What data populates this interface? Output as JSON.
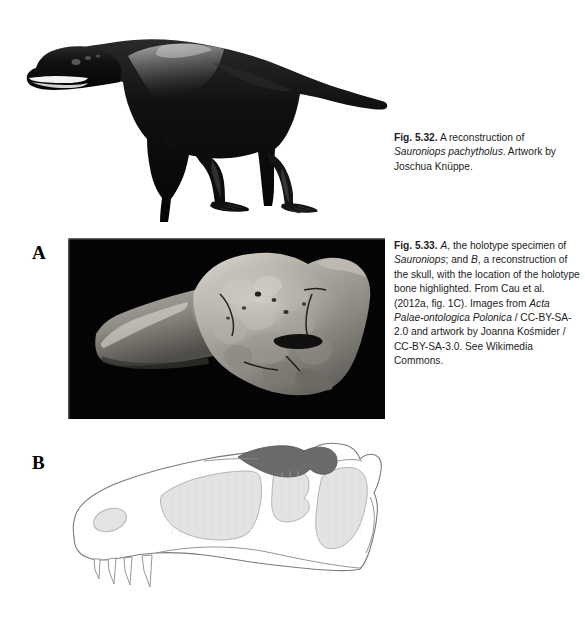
{
  "page": {
    "background_color": "#ffffff",
    "width": 585,
    "height": 621
  },
  "figures": [
    {
      "id": "fig-5-32",
      "number": "Fig. 5.32.",
      "artwork_name": "sauroniops-life-reconstruction",
      "artwork_description": "Black silhouette-style life reconstruction of a large theropod dinosaur standing in left lateral view",
      "caption": {
        "number": "Fig. 5.32.",
        "text_part_1": "A reconstruction of ",
        "italic_1": "Sauroniops pachytholus",
        "text_part_2": ". Artwork by Joschua Knüppe."
      }
    },
    {
      "id": "fig-5-33",
      "number": "Fig. 5.33.",
      "panels": [
        {
          "letter": "A",
          "name": "holotype-specimen-photograph",
          "description": "Grayscale photograph of the holotype frontal bone on a black background"
        },
        {
          "letter": "B",
          "name": "skull-reconstruction-diagram",
          "description": "Line-drawing reconstruction of the skull in left lateral view with the holotype bone shaded dark"
        }
      ],
      "caption": {
        "number": "Fig. 5.33.",
        "italic_1": "A",
        "text_part_1": ", the holotype specimen of ",
        "italic_2": "Sauroniops",
        "text_part_2": "; and ",
        "italic_3": "B",
        "text_part_3": ", a reconstruction of the skull, with the location of the holotype bone highlighted. From Cau et al. (2012a, fig. 1C). Images from ",
        "italic_4": "Acta Palae-ontologica Polonica",
        "text_part_4": " / CC-BY-SA-2.0 and artwork by Joanna Kośmider / CC-BY-SA-3.0. See Wikimedia Commons."
      }
    }
  ],
  "colors": {
    "page_background": "#ffffff",
    "text": "#1c1c1c",
    "photo_background": "#040404",
    "skull_outline": "#6e6e6e",
    "fenestra_fill": "#e3e3e3",
    "highlighted_bone_fill": "#6b6b6b",
    "silhouette": "#0a0a0a"
  }
}
